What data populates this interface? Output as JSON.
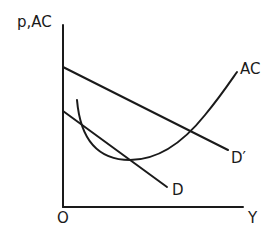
{
  "diagram": {
    "type": "economics-cost-demand",
    "axes": {
      "y_label": "p,AC",
      "x_label": "Y",
      "origin_label": "O"
    },
    "curves": [
      {
        "id": "AC",
        "label": "AC",
        "kind": "U-shaped average cost curve"
      },
      {
        "id": "D_prime",
        "label": "D′",
        "kind": "downward-sloping demand (higher)"
      },
      {
        "id": "D",
        "label": "D",
        "kind": "downward-sloping demand (lower)"
      }
    ],
    "colors": {
      "ink": "#1a1a1a",
      "background": "#ffffff"
    }
  }
}
